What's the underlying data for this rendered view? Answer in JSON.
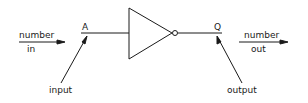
{
  "diagram": {
    "type": "logic-gate",
    "gate": "NOT (inverter)",
    "input_pin": "A",
    "output_pin": "Q",
    "input_flow": {
      "line1": "number",
      "line2": "in"
    },
    "output_flow": {
      "line1": "number",
      "line2": "out"
    },
    "input_callout": "input",
    "output_callout": "output",
    "stroke_color": "#1a1a1a",
    "background": "#ffffff"
  }
}
